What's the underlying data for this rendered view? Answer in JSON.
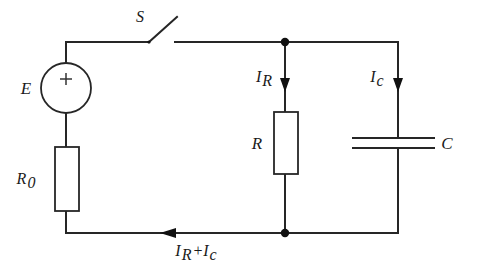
{
  "diagram": {
    "background_color": "#ffffff",
    "line_color": "#262626"
  },
  "labels": {
    "source": "E",
    "source_polarity": "+",
    "switch": "S",
    "series_resistor": "R",
    "series_resistor_sub": "0",
    "parallel_resistor": "R",
    "capacitor": "C",
    "current_r": "I",
    "current_r_sub": "R",
    "current_c": "I",
    "current_c_sub": "c",
    "total_current_first": "I",
    "total_current_first_sub": "R",
    "total_current_op": "+",
    "total_current_second": "I",
    "total_current_second_sub": "c"
  },
  "components": {
    "voltage_source": {
      "name": "E",
      "symbol": "circle-with-plus",
      "cx": 66,
      "cy": 88,
      "r": 25
    },
    "resistor_r0": {
      "name": "R0",
      "symbol": "rectangle",
      "x": 55,
      "y": 147,
      "width": 24,
      "height": 64
    },
    "resistor_r": {
      "name": "R",
      "symbol": "rectangle",
      "x": 274,
      "y": 112,
      "width": 24,
      "height": 62
    },
    "capacitor_c": {
      "name": "C",
      "symbol": "parallel-plates",
      "plate_y_top": 138,
      "plate_y_bottom": 148,
      "plate_x1": 352,
      "plate_x2": 435
    },
    "switch_s": {
      "name": "S",
      "symbol": "open-switch",
      "hinge_x": 148,
      "hinge_y": 42,
      "tip_x": 176,
      "tip_y": 18
    }
  },
  "nodes": {
    "top_junction": {
      "x": 285,
      "y": 42
    },
    "bottom_junction": {
      "x": 285,
      "y": 233
    }
  },
  "currents": {
    "i_r": {
      "direction": "down",
      "x": 285,
      "y_from": 50,
      "y_to": 90
    },
    "i_c": {
      "direction": "down",
      "x": 398,
      "y_from": 50,
      "y_to": 90
    },
    "i_total": {
      "direction": "left",
      "y": 233,
      "x_from": 200,
      "x_to": 160
    }
  }
}
